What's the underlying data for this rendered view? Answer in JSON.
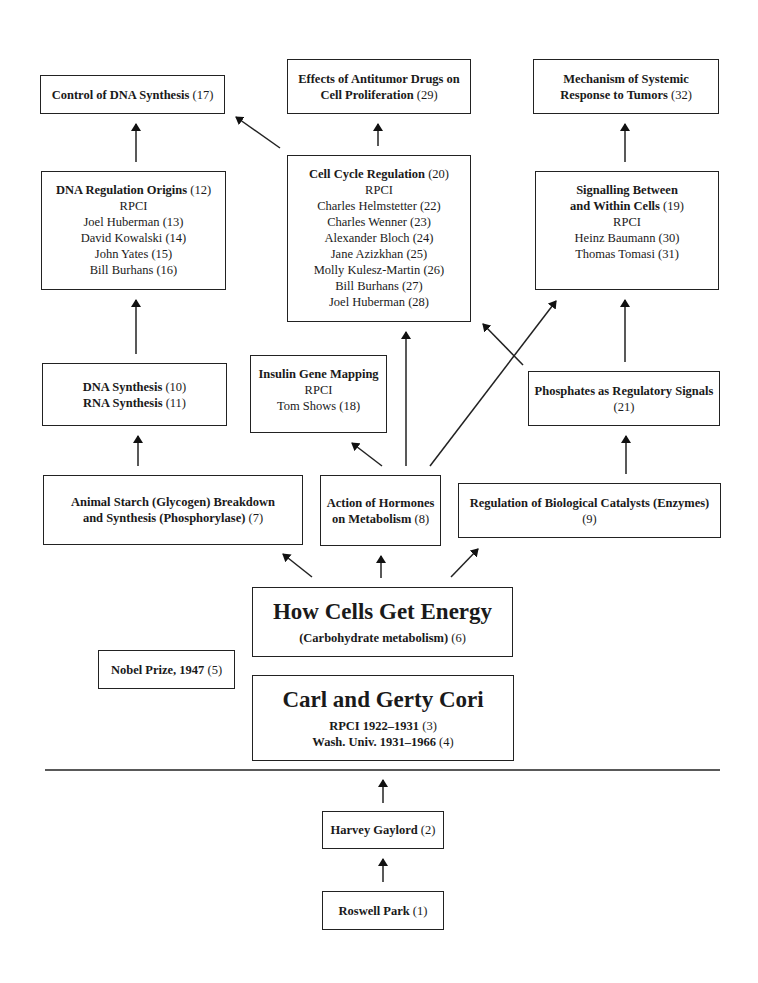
{
  "diagram": {
    "nodes": {
      "control_dna": {
        "title": "Control of DNA Synthesis",
        "num": "(17)"
      },
      "antitumor": {
        "title_line1": "Effects of Antitumor Drugs on",
        "title_line2": "Cell Proliferation",
        "num": "(29)"
      },
      "systemic": {
        "title_line1": "Mechanism of Systemic",
        "title_line2": "Response to Tumors",
        "num": "(32)"
      },
      "dna_regulation": {
        "title": "DNA Regulation Origins",
        "num": "(12)",
        "institution": "RPCI",
        "people": [
          "Joel Huberman (13)",
          "David Kowalski (14)",
          "John Yates (15)",
          "Bill Burhans (16)"
        ]
      },
      "cell_cycle": {
        "title": "Cell Cycle Regulation",
        "num": "(20)",
        "institution": "RPCI",
        "people": [
          "Charles Helmstetter (22)",
          "Charles Wenner (23)",
          "Alexander Bloch (24)",
          "Jane Azizkhan (25)",
          "Molly Kulesz-Martin (26)",
          "Bill Burhans (27)",
          "Joel Huberman (28)"
        ]
      },
      "signalling": {
        "title_line1": "Signalling Between",
        "title_line2": "and Within Cells",
        "num": "(19)",
        "institution": "RPCI",
        "people": [
          "Heinz Baumann (30)",
          "Thomas Tomasi (31)"
        ]
      },
      "dna_rna": {
        "line1_title": "DNA Synthesis",
        "line1_num": "(10)",
        "line2_title": "RNA Synthesis",
        "line2_num": "(11)"
      },
      "insulin": {
        "title": "Insulin Gene Mapping",
        "institution": "RPCI",
        "person": "Tom Shows (18)"
      },
      "phosphates": {
        "title": "Phosphates as Regulatory Signals",
        "num": "(21)"
      },
      "animal_starch": {
        "title_line1": "Animal Starch (Glycogen) Breakdown",
        "title_line2": "and Synthesis (Phosphorylase)",
        "num": "(7)"
      },
      "hormones": {
        "title_line1": "Action of Hormones",
        "title_line2": "on Metabolism",
        "num": "(8)"
      },
      "enzymes": {
        "title": "Regulation of Biological Catalysts (Enzymes)",
        "num": "(9)"
      },
      "energy": {
        "title": "How Cells Get Energy",
        "subtitle": "(Carbohydrate metabolism)",
        "num": "(6)"
      },
      "nobel": {
        "title": "Nobel Prize, 1947",
        "num": "(5)"
      },
      "cori": {
        "title": "Carl and Gerty Cori",
        "line1": "RPCI 1922–1931",
        "line1_num": "(3)",
        "line2": "Wash. Univ. 1931–1966",
        "line2_num": "(4)"
      },
      "gaylord": {
        "title": "Harvey Gaylord",
        "num": "(2)"
      },
      "roswell": {
        "title": "Roswell Park",
        "num": "(1)"
      }
    },
    "edges": [
      {
        "from": "roswell",
        "to": "gaylord"
      },
      {
        "from": "gaylord",
        "to": "cori"
      },
      {
        "from": "energy",
        "to": "animal_starch"
      },
      {
        "from": "energy",
        "to": "hormones"
      },
      {
        "from": "energy",
        "to": "enzymes"
      },
      {
        "from": "animal_starch",
        "to": "dna_rna"
      },
      {
        "from": "dna_rna",
        "to": "dna_regulation"
      },
      {
        "from": "dna_regulation",
        "to": "control_dna"
      },
      {
        "from": "hormones",
        "to": "insulin"
      },
      {
        "from": "hormones",
        "to": "cell_cycle"
      },
      {
        "from": "hormones",
        "to": "signalling"
      },
      {
        "from": "phosphates",
        "to": "cell_cycle"
      },
      {
        "from": "enzymes",
        "to": "phosphates"
      },
      {
        "from": "phosphates",
        "to": "signalling"
      },
      {
        "from": "cell_cycle",
        "to": "control_dna"
      },
      {
        "from": "cell_cycle",
        "to": "antitumor"
      },
      {
        "from": "signalling",
        "to": "systemic"
      }
    ],
    "colors": {
      "stroke": "#222222",
      "text": "#1a1a1a",
      "background": "#ffffff"
    }
  }
}
